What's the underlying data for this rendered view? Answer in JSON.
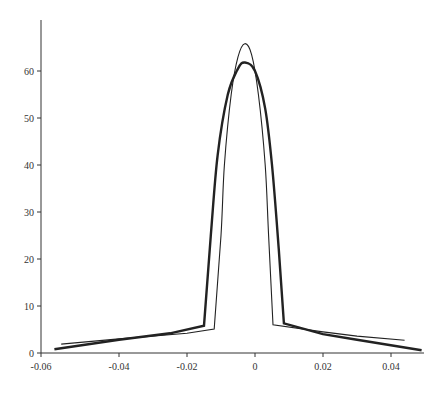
{
  "chart_data": {
    "type": "line",
    "title": "",
    "xlabel": "",
    "ylabel": "",
    "xlim": [
      -0.06,
      0.048
    ],
    "ylim": [
      0,
      69
    ],
    "grid": false,
    "legend": null,
    "x_ticks": [
      "-0.06",
      "-0.04",
      "-0.02",
      "0",
      "0.02",
      "0.04"
    ],
    "y_ticks": [
      "0",
      "10",
      "20",
      "30",
      "40",
      "50",
      "60"
    ],
    "series": [
      {
        "name": "thin-curve",
        "style": "thin",
        "points": [
          [
            -0.057,
            1.9
          ],
          [
            -0.04,
            3.0
          ],
          [
            -0.02,
            4.2
          ],
          [
            -0.012,
            5.1
          ],
          [
            -0.01,
            25
          ],
          [
            -0.009,
            40
          ],
          [
            -0.007,
            55
          ],
          [
            -0.005,
            63
          ],
          [
            -0.003,
            65.8
          ],
          [
            -0.001,
            63.5
          ],
          [
            0.001,
            55
          ],
          [
            0.003,
            40
          ],
          [
            0.004,
            25
          ],
          [
            0.0053,
            6.0
          ],
          [
            0.02,
            4.5
          ],
          [
            0.03,
            3.6
          ],
          [
            0.044,
            2.7
          ]
        ]
      },
      {
        "name": "thick-curve",
        "style": "thick",
        "points": [
          [
            -0.059,
            0.8
          ],
          [
            -0.04,
            2.8
          ],
          [
            -0.025,
            4.2
          ],
          [
            -0.015,
            5.8
          ],
          [
            -0.013,
            25
          ],
          [
            -0.011,
            42
          ],
          [
            -0.008,
            55
          ],
          [
            -0.005,
            60.5
          ],
          [
            -0.003,
            61.8
          ],
          [
            0.0,
            60.0
          ],
          [
            0.003,
            52
          ],
          [
            0.005,
            40
          ],
          [
            0.007,
            22
          ],
          [
            0.0085,
            6.3
          ],
          [
            0.02,
            4.0
          ],
          [
            0.03,
            2.8
          ],
          [
            0.049,
            0.6
          ]
        ]
      }
    ]
  }
}
